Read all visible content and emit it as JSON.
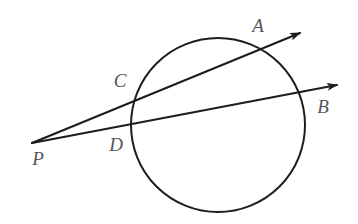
{
  "figure": {
    "kind": "geometry-diagram",
    "background_color": "#ffffff",
    "stroke_color": "#1d1d1f",
    "label_color": "#55565a",
    "stroke_width": 2,
    "width": 358,
    "height": 224
  },
  "circle": {
    "name": "circle",
    "cx": 218,
    "cy": 125,
    "r": 87
  },
  "points": [
    {
      "id": "A",
      "label": "A",
      "x": 262,
      "y": 50,
      "label_x": 258,
      "label_y": 28,
      "role": "far-intersection-upper-secant"
    },
    {
      "id": "B",
      "label": "B",
      "x": 305,
      "y": 92,
      "label_x": 323,
      "label_y": 109,
      "role": "far-intersection-lower-secant"
    },
    {
      "id": "C",
      "label": "C",
      "x": 137,
      "y": 99,
      "label_x": 120,
      "label_y": 83,
      "role": "near-intersection-upper-secant"
    },
    {
      "id": "D",
      "label": "D",
      "x": 133,
      "y": 130,
      "label_x": 116,
      "label_y": 147,
      "role": "near-intersection-lower-secant"
    },
    {
      "id": "P",
      "label": "P",
      "x": 32,
      "y": 143,
      "label_x": 38,
      "label_y": 161,
      "role": "external-vertex"
    }
  ],
  "rays": [
    {
      "id": "ray-PA",
      "name": "secant-ray-p-c-a",
      "from": "P",
      "through": [
        "C",
        "A"
      ],
      "x1": 32,
      "y1": 143,
      "x2": 300,
      "y2": 33,
      "arrow": true
    },
    {
      "id": "ray-PB",
      "name": "secant-ray-p-d-b",
      "from": "P",
      "through": [
        "D",
        "B"
      ],
      "x1": 32,
      "y1": 143,
      "x2": 337,
      "y2": 85,
      "arrow": true
    }
  ]
}
